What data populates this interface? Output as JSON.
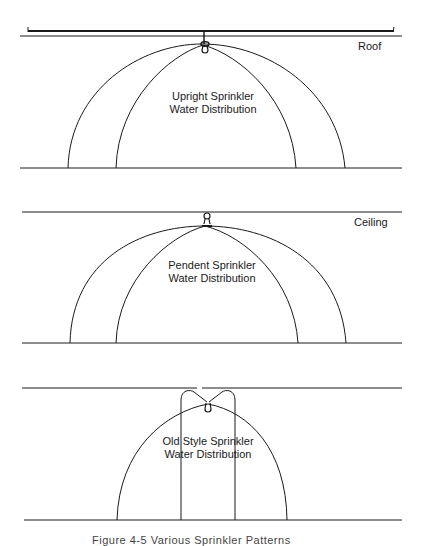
{
  "panels": [
    {
      "id": "upright",
      "surface_label": "Roof",
      "title_line1": "Upright Sprinkler",
      "title_line2": "Water Distribution"
    },
    {
      "id": "pendent",
      "surface_label": "Ceiling",
      "title_line1": "Pendent Sprinkler",
      "title_line2": "Water Distribution"
    },
    {
      "id": "old-style",
      "surface_label": "",
      "title_line1": "Old Style Sprinkler",
      "title_line2": "Water Distribution"
    }
  ],
  "caption": "Figure 4-5  Various Sprinkler Patterns",
  "colors": {
    "line": "#1a1a1a",
    "background": "#ffffff"
  }
}
